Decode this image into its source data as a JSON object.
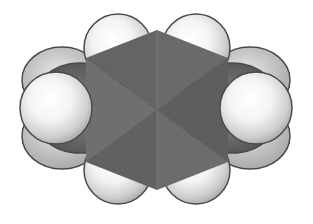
{
  "figure": {
    "description": "Space-filling model of a para-disubstituted benzene ring (p-xylene) shown face-on: gray hexagonal carbon ring, four ring hydrogens above and below, two methyl groups at left and right.",
    "background": "#ffffff"
  },
  "colors": {
    "carbon_dark": "#5a5a5a",
    "carbon_mid": "#6e6e6e",
    "carbon_light": "#828282",
    "hydrogen_light": "#ffffff",
    "hydrogen_shade": "#b8b8b8",
    "outline": "#4a4a4a"
  },
  "atoms": {
    "ring_carbons": 6,
    "ring_hydrogens": 4,
    "methyl_groups": 2
  }
}
